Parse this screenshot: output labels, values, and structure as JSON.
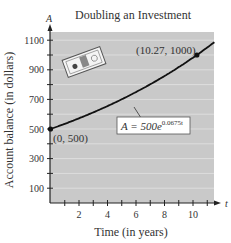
{
  "chart_data": {
    "type": "line",
    "title": "Doubling an Investment",
    "xlabel": "Time (in years)",
    "ylabel": "Account balance (in dollars)",
    "x_axis_var": "t",
    "y_axis_var": "A",
    "xlim": [
      0,
      11.5
    ],
    "ylim": [
      0,
      1150
    ],
    "x_ticks": [
      2,
      4,
      6,
      8,
      10
    ],
    "y_ticks": [
      100,
      300,
      500,
      700,
      900,
      1100
    ],
    "grid": true,
    "series": [
      {
        "name": "A = 500e^(0.0675t)",
        "equation": "A = 500e^{0.0675t}",
        "x": [
          0,
          1,
          2,
          3,
          4,
          5,
          6,
          7,
          8,
          9,
          10,
          10.27,
          11,
          11.5
        ],
        "values": [
          500,
          535,
          572,
          612,
          655,
          701,
          750,
          803,
          859,
          919,
          984,
          1000,
          1051,
          1088
        ]
      }
    ],
    "points": [
      {
        "label": "(0, 500)",
        "x": 0,
        "y": 500
      },
      {
        "label": "(10.27, 1000)",
        "x": 10.27,
        "y": 1000
      }
    ],
    "annotations": {
      "equation_base": "A = 500e",
      "equation_exp": "0.0675t"
    }
  }
}
